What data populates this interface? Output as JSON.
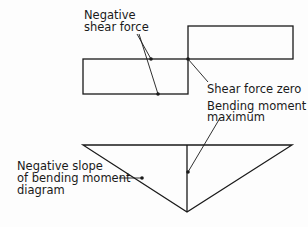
{
  "diagram": {
    "type": "shear force and bending moment diagram",
    "labels": {
      "negative_shear_force_line1": "Negative",
      "negative_shear_force_line2": "shear force",
      "shear_force_zero": "Shear force zero",
      "bending_moment_max_line1": "Bending moment",
      "bending_moment_max_line2": "maximum",
      "negative_slope_line1": "Negative slope",
      "negative_slope_line2": "of bending moment",
      "negative_slope_line3": "diagram"
    },
    "colors": {
      "stroke": "#1a1a1a",
      "background": "#fdfdfd"
    }
  }
}
